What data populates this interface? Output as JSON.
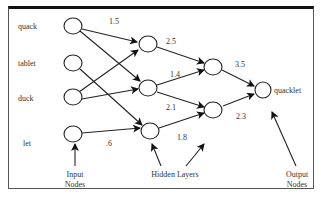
{
  "diagram": {
    "type": "neural-network",
    "input_nodes": [
      {
        "label": "quack",
        "x": 73,
        "y": 26
      },
      {
        "label": "tablet",
        "x": 73,
        "y": 63
      },
      {
        "label": "duck",
        "x": 73,
        "y": 97
      },
      {
        "label": "let",
        "x": 73,
        "y": 134
      }
    ],
    "hidden_layer_1": [
      {
        "x": 148,
        "y": 44
      },
      {
        "x": 148,
        "y": 88
      },
      {
        "x": 150,
        "y": 131
      }
    ],
    "hidden_layer_2": [
      {
        "x": 213,
        "y": 67
      },
      {
        "x": 213,
        "y": 110
      }
    ],
    "output_nodes": [
      {
        "label": "quacklet",
        "x": 263,
        "y": 90
      }
    ],
    "edges": [
      {
        "from": "quack",
        "to": "h1_0"
      },
      {
        "from": "quack",
        "to": "h1_1"
      },
      {
        "from": "tablet",
        "to": "h1_2"
      },
      {
        "from": "duck",
        "to": "h1_0"
      },
      {
        "from": "duck",
        "to": "h1_1"
      },
      {
        "from": "let",
        "to": "h1_2"
      },
      {
        "from": "h1_0",
        "to": "h2_0"
      },
      {
        "from": "h1_1",
        "to": "h2_0"
      },
      {
        "from": "h1_1",
        "to": "h2_1"
      },
      {
        "from": "h1_2",
        "to": "h2_1"
      },
      {
        "from": "h2_0",
        "to": "quacklet"
      },
      {
        "from": "h2_1",
        "to": "quacklet"
      }
    ],
    "weights": [
      {
        "text": "1.5",
        "x": 109,
        "y": 17
      },
      {
        "text": "2.5",
        "x": 166,
        "y": 37
      },
      {
        "text": "1.4",
        "x": 170,
        "y": 70
      },
      {
        "text": "2.1",
        "x": 166,
        "y": 103
      },
      {
        "text": "1.8",
        "x": 177,
        "y": 133
      },
      {
        "text": "3.5",
        "x": 235,
        "y": 60
      },
      {
        "text": "2.3",
        "x": 236,
        "y": 112
      },
      {
        "text": ".6",
        "x": 105,
        "y": 139
      }
    ],
    "annotations": {
      "input": "Input\nNodes",
      "input_line1": "Input",
      "input_line2": "Nodes",
      "hidden": "Hidden Layers",
      "output_line1": "Output",
      "output_line2": "Nodes"
    }
  }
}
